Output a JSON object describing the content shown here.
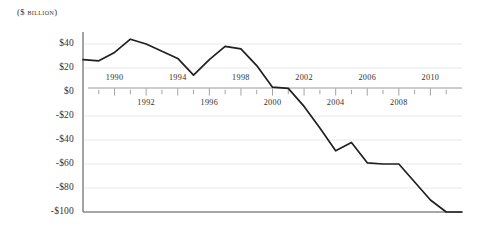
{
  "chart_data": {
    "type": "line",
    "title": "",
    "subtitle": "",
    "unit_label": "($ billion)",
    "xlabel": "",
    "ylabel": "",
    "ylim": [
      -100,
      50
    ],
    "xlim": [
      1988,
      2012
    ],
    "grid": true,
    "legend": null,
    "y_ticks": [
      40,
      20,
      0,
      -20,
      -40,
      -60,
      -80,
      -100
    ],
    "y_tick_labels": [
      "$40",
      "$20",
      "$0",
      "-$20",
      "-$40",
      "-$60",
      "-$80",
      "-$100"
    ],
    "x_ticks_above": [
      "1990",
      "1994",
      "1998",
      "2002",
      "2006",
      "2010"
    ],
    "x_ticks_below": [
      "1992",
      "1996",
      "2000",
      "2004",
      "2008"
    ],
    "x": [
      1988,
      1989,
      1990,
      1991,
      1992,
      1993,
      1994,
      1995,
      1996,
      1997,
      1998,
      1999,
      2000,
      2001,
      2002,
      2003,
      2004,
      2005,
      2006,
      2007,
      2008,
      2009,
      2010,
      2011,
      2012
    ],
    "values": [
      27,
      26,
      33,
      44,
      40,
      34,
      28,
      14,
      27,
      38,
      36,
      22,
      4,
      3,
      -12,
      -30,
      -49,
      -42,
      -59,
      -60,
      -60,
      -75,
      -90,
      -100,
      -100
    ],
    "series": [
      {
        "name": "Balance",
        "color": "#221f1f",
        "values": [
          27,
          26,
          33,
          44,
          40,
          34,
          28,
          14,
          27,
          38,
          36,
          22,
          4,
          3,
          -12,
          -30,
          -49,
          -42,
          -59,
          -60,
          -60,
          -75,
          -90,
          -100,
          -100
        ]
      }
    ],
    "colors": {
      "line": "#221f1f",
      "axis": "#8c8c8c",
      "grid": "#e8e8e8",
      "zero_axis": "#9a9a9a",
      "text": "#34302e"
    }
  }
}
